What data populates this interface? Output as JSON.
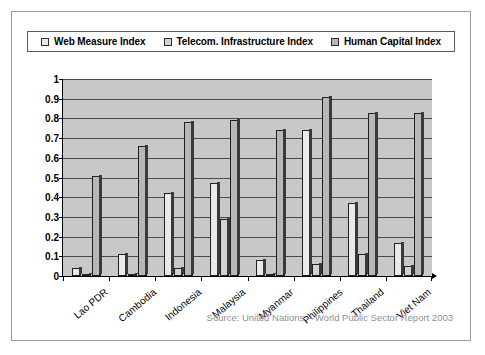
{
  "figure": {
    "source_note": "Source: United Nations – World Public Sector Report 2003"
  },
  "legend": {
    "position": "top",
    "entries": [
      {
        "label": "Web Measure Index",
        "swatch": "legend-swatch-web-measure",
        "color": "#e9e9e9"
      },
      {
        "label": "Telecom. Infrastructure Index",
        "swatch": "legend-swatch-telecom-infrastructure",
        "color": "#d2d2d2"
      },
      {
        "label": "Human Capital Index",
        "swatch": "legend-swatch-human-capital",
        "color": "#b7b7b7"
      }
    ]
  },
  "axes": {
    "y_ticks": [
      "0",
      "0.1",
      "0.2",
      "0.3",
      "0.4",
      "0.5",
      "0.6",
      "0.7",
      "0.8",
      "0.9",
      "1"
    ],
    "x_labels": [
      "Lao PDR",
      "Cambodia",
      "Indonesia",
      "Malaysia",
      "Myanmar",
      "Philippines",
      "Thailand",
      "Viet Nam"
    ]
  },
  "chart_data": {
    "type": "bar",
    "title": "",
    "subtitle": "",
    "xlabel": "",
    "ylabel": "",
    "ylim": [
      0,
      1
    ],
    "ytick_step": 0.1,
    "grid": true,
    "legend_position": "top",
    "categories": [
      "Lao PDR",
      "Cambodia",
      "Indonesia",
      "Malaysia",
      "Myanmar",
      "Philippines",
      "Thailand",
      "Viet Nam"
    ],
    "series": [
      {
        "name": "Web Measure Index",
        "color": "#e9e9e9",
        "values": [
          0.04,
          0.11,
          0.42,
          0.47,
          0.08,
          0.74,
          0.37,
          0.17
        ]
      },
      {
        "name": "Telecom. Infrastructure Index",
        "color": "#d2d2d2",
        "values": [
          0.01,
          0.01,
          0.04,
          0.29,
          0.01,
          0.06,
          0.11,
          0.05
        ]
      },
      {
        "name": "Human Capital Index",
        "color": "#b7b7b7",
        "values": [
          0.51,
          0.66,
          0.78,
          0.79,
          0.74,
          0.91,
          0.83,
          0.83
        ]
      }
    ],
    "annotations": [
      "Source: United Nations – World Public Sector Report 2003"
    ],
    "plot_background": "#c8c8c8"
  }
}
